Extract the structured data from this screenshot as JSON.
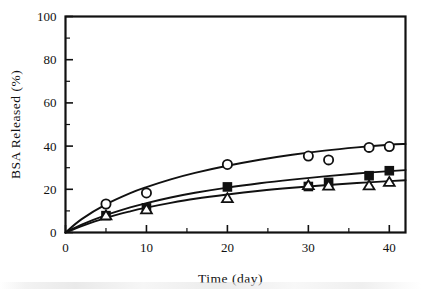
{
  "chart_data": {
    "type": "scatter",
    "title": "",
    "xlabel": "Time  (day)",
    "ylabel": "BSA  Released  (%)",
    "xlim": [
      0,
      42
    ],
    "ylim": [
      0,
      100
    ],
    "xticks": [
      0,
      10,
      20,
      30,
      40
    ],
    "xticklabels": [
      "0",
      "10",
      "20",
      "30",
      "40"
    ],
    "xminorticks": [
      5,
      15,
      25,
      35
    ],
    "yticks": [
      0,
      20,
      40,
      60,
      80,
      100
    ],
    "yticklabels": [
      "0",
      "20",
      "40",
      "60",
      "80",
      "100"
    ],
    "yminorticks": [
      10,
      30,
      50,
      70,
      90
    ],
    "grid": false,
    "legend": "none",
    "series": [
      {
        "name": "open-circle",
        "marker": "open-circle",
        "x": [
          5,
          10,
          20,
          30,
          32.5,
          37.5,
          40
        ],
        "y": [
          13.2,
          18.3,
          31.5,
          35.4,
          33.6,
          39.4,
          39.8
        ],
        "fit_curve": [
          [
            0,
            0
          ],
          [
            2,
            6.2
          ],
          [
            5,
            13.0
          ],
          [
            8,
            18.2
          ],
          [
            10,
            21.0
          ],
          [
            13,
            24.6
          ],
          [
            16,
            27.6
          ],
          [
            20,
            30.9
          ],
          [
            24,
            33.7
          ],
          [
            28,
            36.0
          ],
          [
            32,
            37.9
          ],
          [
            36,
            39.4
          ],
          [
            40,
            40.6
          ],
          [
            42,
            41.0
          ]
        ]
      },
      {
        "name": "filled-square",
        "marker": "filled-square",
        "x": [
          5,
          10,
          20,
          30,
          32.5,
          37.5,
          40
        ],
        "y": [
          7.8,
          11.4,
          21.1,
          21.3,
          23.2,
          26.3,
          28.6
        ],
        "fit_curve": [
          [
            0,
            0
          ],
          [
            2,
            3.6
          ],
          [
            5,
            8.0
          ],
          [
            8,
            11.6
          ],
          [
            10,
            13.6
          ],
          [
            13,
            16.2
          ],
          [
            16,
            18.4
          ],
          [
            20,
            20.8
          ],
          [
            24,
            22.8
          ],
          [
            28,
            24.5
          ],
          [
            32,
            26.0
          ],
          [
            36,
            27.3
          ],
          [
            40,
            28.4
          ],
          [
            42,
            28.9
          ]
        ]
      },
      {
        "name": "open-triangle",
        "marker": "open-triangle",
        "x": [
          5,
          10,
          20,
          30,
          32.5,
          37.5,
          40
        ],
        "y": [
          7.9,
          10.7,
          15.9,
          21.9,
          21.7,
          21.8,
          23.4
        ],
        "fit_curve": [
          [
            0,
            0
          ],
          [
            2,
            3.0
          ],
          [
            5,
            6.8
          ],
          [
            8,
            9.8
          ],
          [
            10,
            11.5
          ],
          [
            13,
            13.7
          ],
          [
            16,
            15.6
          ],
          [
            20,
            17.6
          ],
          [
            24,
            19.3
          ],
          [
            28,
            20.7
          ],
          [
            32,
            21.9
          ],
          [
            36,
            22.9
          ],
          [
            40,
            23.8
          ],
          [
            42,
            24.2
          ]
        ]
      }
    ]
  }
}
